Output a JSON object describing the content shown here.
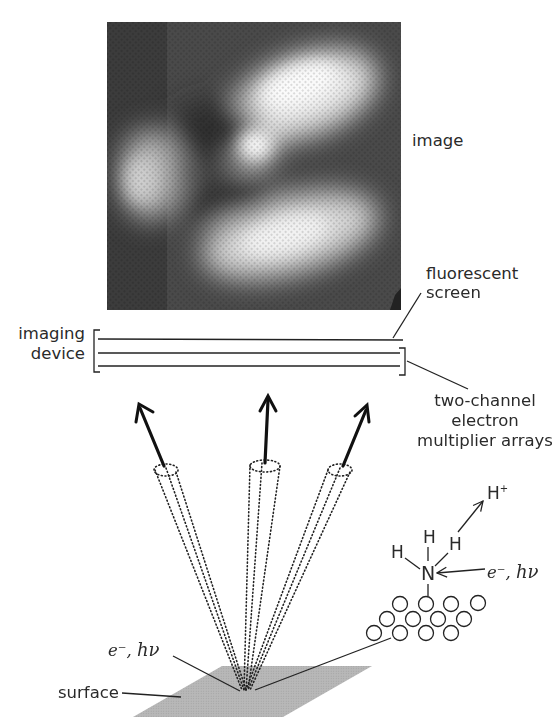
{
  "figure": {
    "image_label": "image",
    "screen_label_line1": "fluorescent",
    "screen_label_line2": "screen",
    "device_label_line1": "imaging",
    "device_label_line2": "device",
    "multiplier_label_line1": "two-channel",
    "multiplier_label_line2": "electron",
    "multiplier_label_line3": "multiplier arrays",
    "surface_label": "surface",
    "excitation_label_e": "e⁻, ",
    "excitation_label_hv": "hν",
    "molecule": {
      "center_atom": "N",
      "h_left": "H",
      "h_top": "H",
      "h_right": "H",
      "ion": "H",
      "ion_charge": "+",
      "excitation_e": "e⁻, ",
      "excitation_hv": "hν"
    },
    "colors": {
      "ink": "#1a1a1a",
      "surface": "#b4b4b4",
      "image_dark": "#3a3a3a",
      "image_bright": "#f4f4f4"
    }
  }
}
